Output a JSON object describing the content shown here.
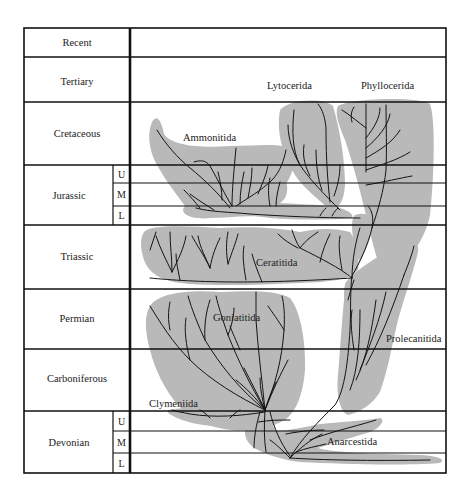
{
  "colors": {
    "range_fill": "#b9b9b9",
    "lines": "#111111",
    "background": "#ffffff"
  },
  "periods": [
    {
      "name": "Recent",
      "subdivisions": []
    },
    {
      "name": "Tertiary",
      "subdivisions": []
    },
    {
      "name": "Cretaceous",
      "subdivisions": []
    },
    {
      "name": "Jurassic",
      "subdivisions": [
        "U",
        "M",
        "L"
      ]
    },
    {
      "name": "Triassic",
      "subdivisions": []
    },
    {
      "name": "Permian",
      "subdivisions": []
    },
    {
      "name": "Carboniferous",
      "subdivisions": []
    },
    {
      "name": "Devonian",
      "subdivisions": [
        "U",
        "M",
        "L"
      ]
    }
  ],
  "taxa": [
    {
      "name": "Lytocerida",
      "range": "Jurassic (L) – Cretaceous"
    },
    {
      "name": "Phyllocerida",
      "range": "Triassic – Cretaceous"
    },
    {
      "name": "Ammonitida",
      "range": "Jurassic (L) – Cretaceous"
    },
    {
      "name": "Ceratitida",
      "range": "Permian – Triassic"
    },
    {
      "name": "Goniatitida",
      "range": "Devonian (M) – Permian"
    },
    {
      "name": "Prolecanitida",
      "range": "Devonian (U) – Triassic"
    },
    {
      "name": "Clymeniida",
      "range": "Devonian (U)"
    },
    {
      "name": "Anarcestida",
      "range": "Devonian (L) – Devonian (U)"
    }
  ]
}
